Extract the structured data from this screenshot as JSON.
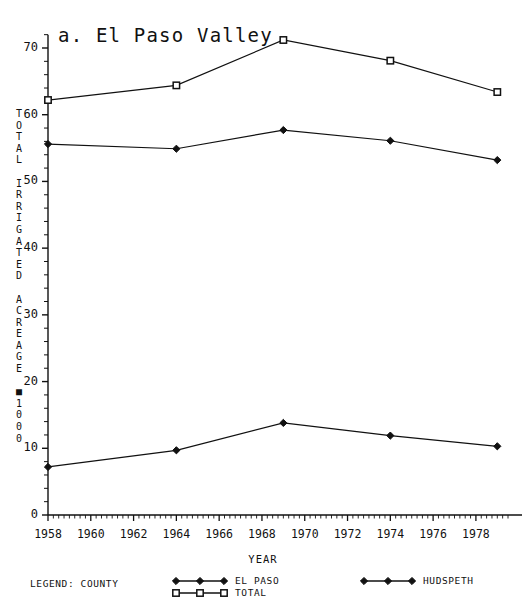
{
  "chart_data": {
    "type": "line",
    "title": "a. El Paso Valley",
    "xlabel": "YEAR",
    "ylabel": "TOTAL IRRIGATED ACREAGE * 1000",
    "ylabel_lines": [
      "TOTAL",
      "IRRIGATED",
      "ACREAGE",
      "*1000"
    ],
    "x": [
      1958,
      1964,
      1969,
      1974,
      1979
    ],
    "xlim": [
      1958,
      1979.5
    ],
    "ylim": [
      0,
      72
    ],
    "xticks": [
      1958,
      1960,
      1962,
      1964,
      1966,
      1968,
      1970,
      1972,
      1974,
      1976,
      1978
    ],
    "xtick_labels": [
      "1958",
      "1960",
      "1962",
      "1964",
      "1966",
      "1968",
      "1970",
      "1972",
      "1974",
      "1976",
      "1978"
    ],
    "yticks": [
      0,
      10,
      20,
      30,
      40,
      50,
      60,
      70
    ],
    "ytick_labels": [
      "0",
      "10",
      "20",
      "30",
      "40",
      "50",
      "60",
      "70"
    ],
    "y_minor_tick_step": 2,
    "x_minor_tick_step": 0.25,
    "grid": false,
    "legend_position": "below-axes",
    "line_color": "#111111",
    "background_color": "#ffffff",
    "series": [
      {
        "name": "TOTAL",
        "marker": "open-square",
        "values": [
          62.2,
          64.4,
          71.2,
          68.1,
          63.4
        ]
      },
      {
        "name": "EL PASO",
        "marker": "filled-diamond",
        "values": [
          55.6,
          54.9,
          57.7,
          56.1,
          53.2
        ]
      },
      {
        "name": "HUDSPETH",
        "marker": "filled-diamond",
        "values": [
          7.2,
          9.7,
          13.8,
          11.9,
          10.3
        ]
      }
    ]
  },
  "legend": {
    "title": "LEGEND: COUNTY",
    "entries": [
      {
        "label": "EL PASO",
        "marker": "filled-diamond"
      },
      {
        "label": "TOTAL",
        "marker": "open-square"
      },
      {
        "label": "HUDSPETH",
        "marker": "filled-diamond"
      }
    ]
  }
}
